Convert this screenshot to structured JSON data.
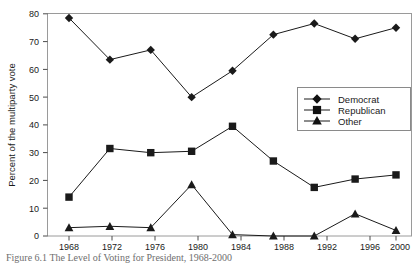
{
  "chart_data": {
    "type": "line",
    "title": "",
    "xlabel": "",
    "ylabel": "Percent of the multiparty vote",
    "categories": [
      "1968",
      "1972",
      "1976",
      "1980",
      "1984",
      "1988",
      "1992",
      "1996",
      "2000"
    ],
    "x": [
      1968,
      1972,
      1976,
      1980,
      1984,
      1988,
      1992,
      1996,
      2000
    ],
    "series": [
      {
        "name": "Democrat",
        "marker": "diamond",
        "values": [
          78.5,
          63.5,
          67.0,
          50.0,
          59.5,
          72.5,
          76.5,
          71.0,
          75.0
        ]
      },
      {
        "name": "Republican",
        "marker": "square",
        "values": [
          14.0,
          31.5,
          30.0,
          30.5,
          39.5,
          27.0,
          17.5,
          20.5,
          22.0
        ]
      },
      {
        "name": "Other",
        "marker": "triangle",
        "values": [
          3.0,
          3.5,
          3.0,
          18.5,
          0.5,
          0.0,
          0.0,
          8.0,
          2.0
        ]
      }
    ],
    "ylim": [
      0,
      80
    ],
    "ytick_labels": [
      "0",
      "10",
      "20",
      "30",
      "40",
      "50",
      "60",
      "70",
      "80"
    ],
    "ytick_values": [
      0,
      10,
      20,
      30,
      40,
      50,
      60,
      70,
      80
    ],
    "grid": false,
    "legend_position": "center-right",
    "series_color": "#1a1a1a"
  },
  "legend": {
    "entries": [
      {
        "label": "Democrat",
        "marker": "diamond-marker-icon"
      },
      {
        "label": "Republican",
        "marker": "square-marker-icon"
      },
      {
        "label": "Other",
        "marker": "triangle-marker-icon"
      }
    ]
  },
  "caption": {
    "text": "Figure 6.1  The Level of Voting for President, 1968-2000"
  }
}
